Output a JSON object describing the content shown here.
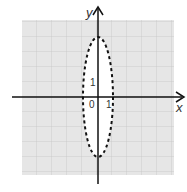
{
  "diagram": {
    "x_label": "x",
    "y_label": "y",
    "origin_label": "0",
    "x_tick_label": "1",
    "y_tick_label": "1",
    "grid_color": "#e6e6e6",
    "grid_line_color": "#bdbdbd",
    "ellipse": {
      "cx": 0,
      "cy": 0,
      "rx": 1,
      "ry": 4,
      "style": "dashed",
      "fill": "#ffffff"
    },
    "grid_range": {
      "x": [
        -5,
        5
      ],
      "y": [
        -5,
        5
      ]
    }
  }
}
